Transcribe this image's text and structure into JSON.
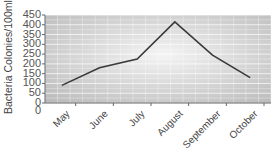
{
  "chart_data": {
    "type": "line",
    "title": "",
    "xlabel": "",
    "ylabel": "Bacteria Colonies/100ml",
    "categories": [
      "May",
      "June",
      "July",
      "August",
      "September",
      "October"
    ],
    "series": [
      {
        "name": "Bacteria Colonies",
        "values": [
          90,
          180,
          225,
          415,
          245,
          130
        ]
      }
    ],
    "ylim": [
      0,
      450
    ],
    "yticks": [
      0,
      50,
      100,
      150,
      200,
      250,
      300,
      350,
      400,
      450
    ],
    "grid": true,
    "legend": "none",
    "colors": {
      "line": "#3a3a3a",
      "grid": "#ffffff",
      "bg_center": "#f4f4f4",
      "bg_edge": "#b9b9b9",
      "axis": "#666666"
    }
  },
  "labels": {
    "title_partial": "",
    "ylabel": "Bacteria Colonies/100ml",
    "y0_extra": "0"
  }
}
